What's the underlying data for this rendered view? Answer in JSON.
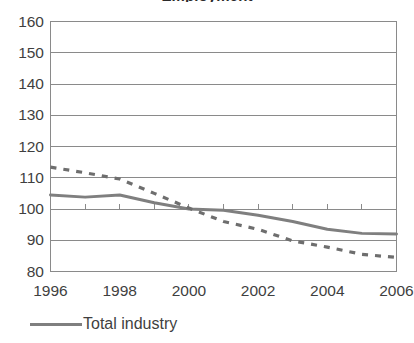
{
  "chart_data": {
    "type": "line",
    "title": "Employment",
    "xlabel": "",
    "ylabel": "",
    "xlim": [
      1996,
      2006
    ],
    "ylim": [
      80,
      160
    ],
    "yticks": [
      80,
      90,
      100,
      110,
      120,
      130,
      140,
      150,
      160
    ],
    "xticks": [
      1996,
      1998,
      2000,
      2002,
      2004,
      2006
    ],
    "xticks_minor": [
      1997,
      1999,
      2001,
      2003,
      2005
    ],
    "grid": "horizontal",
    "legend_position": "bottom-left",
    "x": [
      1996,
      1997,
      1998,
      1999,
      2000,
      2001,
      2002,
      2003,
      2004,
      2005,
      2006
    ],
    "series": [
      {
        "name": "Total industry",
        "style": "solid",
        "color": "#7f7f7f",
        "values": [
          104.5,
          103.8,
          104.5,
          102.0,
          100.0,
          99.6,
          98.0,
          96.0,
          93.5,
          92.2,
          92.0
        ]
      },
      {
        "name": "",
        "style": "dashed",
        "color": "#6e6e6e",
        "values": [
          113.4,
          111.6,
          109.6,
          105.0,
          100.3,
          96.0,
          93.5,
          89.8,
          87.8,
          85.5,
          84.5
        ]
      }
    ]
  },
  "chart": {
    "title": "Employment",
    "y_tick_labels": [
      "160",
      "150",
      "140",
      "130",
      "120",
      "110",
      "100",
      "90",
      "80"
    ],
    "x_tick_labels": [
      "1996",
      "1998",
      "2000",
      "2002",
      "2004",
      "2006"
    ],
    "legend": {
      "label": "Total industry"
    }
  },
  "colors": {
    "series_solid": "#7f7f7f",
    "series_dashed": "#6e6e6e",
    "gridline": "#8a8a8a",
    "axis": "#8a8a8a",
    "text": "#3f3f3f"
  }
}
